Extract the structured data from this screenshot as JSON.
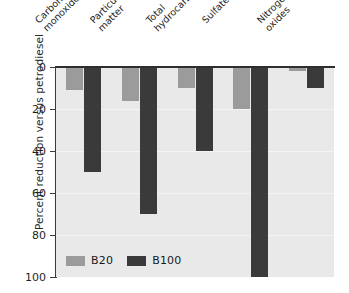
{
  "chart_data": {
    "type": "bar",
    "title": "",
    "subtitle": "",
    "xlabel": "",
    "ylabel": "Percent reduction versus petrodiesel",
    "ylim": [
      0,
      100
    ],
    "y_inverted": true,
    "grid": true,
    "legend_position": "bottom-left",
    "yticks": [
      "0",
      "20",
      "40",
      "60",
      "80",
      "100"
    ],
    "ytick_values": [
      0,
      20,
      40,
      60,
      80,
      100
    ],
    "categories": [
      "Carbon monoxide",
      "Particulate matter",
      "Total hydrocarbons",
      "Sulfates",
      "Nitrogen oxides"
    ],
    "category_lines": [
      [
        "Carbon",
        "monoxide"
      ],
      [
        "Particulate",
        "matter"
      ],
      [
        "Total",
        "hydrocarbons"
      ],
      [
        "Sulfates"
      ],
      [
        "Nitrogen",
        "oxides"
      ]
    ],
    "series": [
      {
        "name": "B20",
        "color": "#9b9b9b",
        "values": [
          11,
          16,
          10,
          20,
          2
        ]
      },
      {
        "name": "B100",
        "color": "#3a3a3a",
        "values": [
          50,
          70,
          40,
          100,
          10
        ]
      }
    ]
  },
  "legend": {
    "entries": [
      {
        "label": "B20",
        "color": "#9b9b9b"
      },
      {
        "label": "B100",
        "color": "#3a3a3a"
      }
    ]
  },
  "colors": {
    "plot_background": "#e9e9e9",
    "page_background": "#ffffff",
    "axis": "#2e2e2e",
    "gridline": "#f4f4f4",
    "text": "#1f1f1f"
  }
}
